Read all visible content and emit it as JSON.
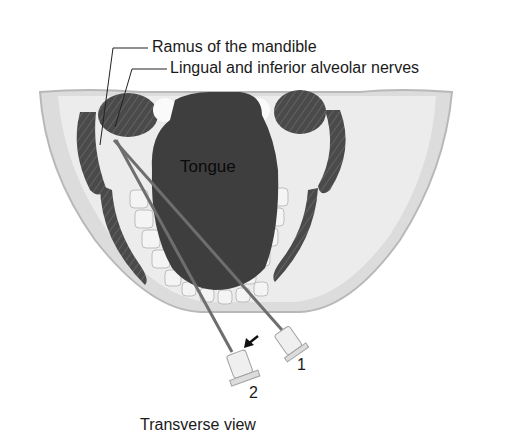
{
  "labels": {
    "ramus": "Ramus of the mandible",
    "nerves": "Lingual and inferior alveolar nerves",
    "tongue": "Tongue",
    "needle1": "1",
    "needle2": "2",
    "caption": "Transverse view"
  },
  "colors": {
    "tongue": "#3e3e3e",
    "muscle": "#4a4a4a",
    "bone": "#e6e6e6",
    "jaw": "#d0d0d0",
    "needle": "#777777"
  }
}
